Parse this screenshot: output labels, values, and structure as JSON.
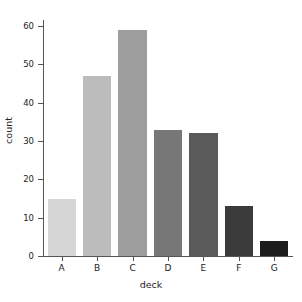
{
  "chart_data": {
    "type": "bar",
    "title": "",
    "xlabel": "deck",
    "ylabel": "count",
    "categories": [
      "A",
      "B",
      "C",
      "D",
      "E",
      "F",
      "G"
    ],
    "values": [
      15,
      47,
      59,
      33,
      32,
      13,
      4
    ],
    "bar_colors": [
      "#d5d5d5",
      "#bcbcbc",
      "#9e9e9e",
      "#777777",
      "#5a5a5a",
      "#3b3b3b",
      "#1c1c1c"
    ],
    "ylim": [
      0,
      60
    ],
    "yticks": [
      0,
      10,
      20,
      30,
      40,
      50,
      60
    ],
    "ytick_labels": [
      "0",
      "10",
      "20",
      "30",
      "40",
      "50",
      "60"
    ],
    "grid": false,
    "legend": "none",
    "background": "#ffffff",
    "axis_color": "#555555"
  }
}
